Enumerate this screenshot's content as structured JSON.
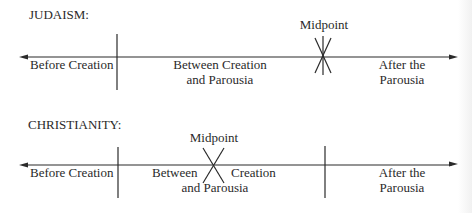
{
  "diagrams": [
    {
      "title": "JUDAISM:",
      "midpoint_label": "Midpoint",
      "segments": [
        {
          "line1": "Before Creation",
          "line2": ""
        },
        {
          "line1": "Between Creation",
          "line2": "and Parousia"
        },
        {
          "line1": "After the",
          "line2": "Parousia"
        }
      ]
    },
    {
      "title": "CHRISTIANITY:",
      "midpoint_label": "Midpoint",
      "segments": [
        {
          "line1": "Before Creation",
          "line2": ""
        },
        {
          "line1": "Between",
          "line1b": "Creation",
          "line2": "and Parousia"
        },
        {
          "line1": "After the",
          "line2": "Parousia"
        }
      ]
    }
  ],
  "colors": {
    "ink": "#2a2a2a",
    "background": "#ffffff"
  }
}
